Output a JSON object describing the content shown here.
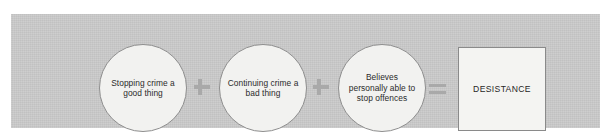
{
  "diagram": {
    "type": "equation-flow",
    "panel_color": "#c9c9c9",
    "node_fill": "#f2f2f0",
    "node_border": "#8e8e8e",
    "operator_color": "#a9a9a9",
    "text_color": "#2b2b2b",
    "terms": [
      {
        "id": "node-1",
        "shape": "ellipse",
        "label": "Stopping crime a good thing"
      },
      {
        "id": "node-2",
        "shape": "ellipse",
        "label": "Continuing crime a bad thing"
      },
      {
        "id": "node-3",
        "shape": "ellipse",
        "label": "Believes personally able to stop offences"
      }
    ],
    "operators": [
      {
        "id": "op-plus-1",
        "symbol": "+",
        "name": "plus"
      },
      {
        "id": "op-plus-2",
        "symbol": "+",
        "name": "plus"
      },
      {
        "id": "op-equals",
        "symbol": "=",
        "name": "equals"
      }
    ],
    "result": {
      "id": "result-box",
      "shape": "rectangle",
      "label": "DESISTANCE"
    }
  }
}
